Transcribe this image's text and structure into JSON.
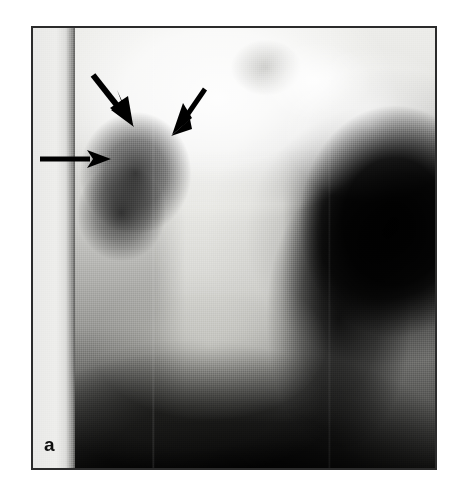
{
  "figure": {
    "panel_letter": "a",
    "caption": "",
    "modality": "radiograph",
    "view": "chest x-ray",
    "frame": {
      "x": 31,
      "y": 26,
      "width": 406,
      "height": 444,
      "border_color": "#2b2b2b",
      "border_width_px": 2
    },
    "page": {
      "background": "#ffffff",
      "width": 465,
      "height": 493
    },
    "image_regions": [
      {
        "name": "left-collimation-strip",
        "description": "bright vertical unexposed strip along left edge"
      },
      {
        "name": "upper-lung-field",
        "description": "bright aerated upper zone across top half"
      },
      {
        "name": "mediastinal-column",
        "description": "bright vertical spine / mediastinum down the midline"
      },
      {
        "name": "left-hilar-opacity",
        "description": "dark rounded opacity left of midline"
      },
      {
        "name": "right-dark-mass",
        "description": "dense black region occupying right side"
      },
      {
        "name": "diaphragm-shadow",
        "description": "dark sweeping shadow across the lower third"
      },
      {
        "name": "aortic-arch-highlight",
        "description": "bright curved arc toward the upper right"
      }
    ],
    "annotations": [
      {
        "id": "arrow-1",
        "type": "arrow",
        "direction": "down-right",
        "color": "#000000",
        "tail": {
          "x": 92,
          "y": 74
        },
        "head": {
          "x": 131,
          "y": 123
        },
        "shaft_width": 6,
        "head_length": 24,
        "head_width": 19
      },
      {
        "id": "arrow-2",
        "type": "arrow",
        "direction": "down-left",
        "color": "#000000",
        "tail": {
          "x": 203,
          "y": 88
        },
        "head": {
          "x": 172,
          "y": 132
        },
        "shaft_width": 5,
        "head_length": 22,
        "head_width": 17
      },
      {
        "id": "arrow-3",
        "type": "arrow",
        "direction": "right",
        "color": "#000000",
        "tail": {
          "x": 38,
          "y": 157
        },
        "head": {
          "x": 108,
          "y": 157
        },
        "shaft_width": 5,
        "head_length": 23,
        "head_width": 17
      }
    ]
  }
}
